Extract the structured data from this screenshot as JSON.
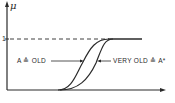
{
  "figure": {
    "y_axis_label": "μ",
    "y_tick_label": "1",
    "curves": [
      {
        "id": "old",
        "label": "A ≙ OLD"
      },
      {
        "id": "very-old",
        "label": "VERY OLD ≙ A*"
      }
    ],
    "colors": {
      "ink": "#2a2a2a",
      "background": "#ffffff"
    }
  }
}
